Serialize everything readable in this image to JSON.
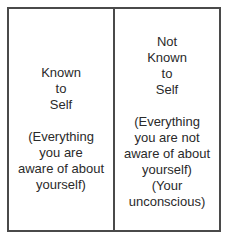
{
  "diagram": {
    "type": "two-quadrant self-awareness window",
    "border_color": "#4a4a4a",
    "text_color": "#2a2a2a",
    "cells": [
      {
        "title_lines": [
          "Known",
          "to",
          "Self"
        ],
        "description_lines": [
          "(Everything",
          "you are",
          "aware of about",
          "yourself)"
        ]
      },
      {
        "title_lines": [
          "Not",
          "Known",
          "to",
          "Self"
        ],
        "description_lines": [
          "(Everything",
          "you are not",
          "aware of about",
          "yourself)",
          "(Your",
          "unconscious)"
        ]
      }
    ]
  }
}
